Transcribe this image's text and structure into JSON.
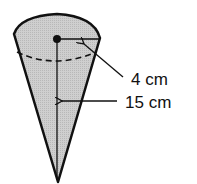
{
  "diagram": {
    "type": "cone",
    "fill_color": "#c8c8c8",
    "stroke_color": "#111111",
    "labels": {
      "radius": "4 cm",
      "height": "15 cm"
    },
    "elements": {
      "center_point": "filled dot at center of circular base",
      "radius_line": "line from center to rim",
      "height_line": "line from center to apex",
      "hidden_edge": "dashed arc representing far side of base"
    }
  }
}
